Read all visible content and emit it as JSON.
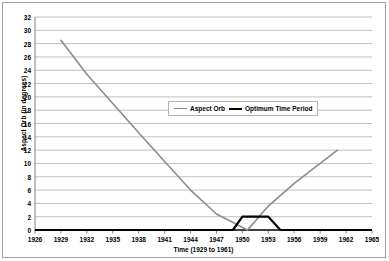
{
  "chart_data": {
    "type": "line",
    "title": "",
    "xlabel": "Time (1929 to 1961)",
    "ylabel": "Aspect Orb (in degrees)",
    "xlim": [
      1926,
      1965
    ],
    "ylim": [
      0,
      32
    ],
    "xticks": [
      1926,
      1929,
      1932,
      1935,
      1938,
      1941,
      1944,
      1947,
      1950,
      1953,
      1956,
      1959,
      1962,
      1965
    ],
    "yticks": [
      0,
      2,
      4,
      6,
      8,
      10,
      12,
      14,
      16,
      18,
      20,
      22,
      24,
      26,
      28,
      30,
      32
    ],
    "grid": "horizontal",
    "legend_position": "upper-center",
    "series": [
      {
        "name": "Aspect Orb",
        "color": "#8c8c8c",
        "x": [
          1929.0,
          1932.0,
          1935.0,
          1938.0,
          1941.0,
          1944.0,
          1947.0,
          1950.6,
          1953.0,
          1956.0,
          1959.0,
          1961.0
        ],
        "values": [
          28.5,
          23.4,
          19.0,
          14.6,
          10.3,
          6.0,
          2.4,
          0.0,
          3.6,
          7.0,
          10.0,
          12.0
        ]
      },
      {
        "name": "Optimum Time Period",
        "color": "#000000",
        "x": [
          1926.0,
          1948.9,
          1950.0,
          1953.0,
          1954.4,
          1965.0
        ],
        "values": [
          0,
          0,
          2,
          2,
          0,
          0
        ]
      }
    ]
  },
  "legend": {
    "items": [
      {
        "label": "Aspect Orb",
        "swatch": "aspect-orb-line-swatch"
      },
      {
        "label": "Optimum Time Period",
        "swatch": "optimum-time-period-line-swatch"
      }
    ]
  },
  "axes": {
    "y_title": "Aspect Orb (in degrees)",
    "x_title": "Time (1929 to 1961)",
    "y_tick_labels": [
      "0",
      "2",
      "4",
      "6",
      "8",
      "10",
      "12",
      "14",
      "16",
      "18",
      "20",
      "22",
      "24",
      "26",
      "28",
      "30",
      "32"
    ],
    "x_tick_labels": [
      "1926",
      "1929",
      "1932",
      "1935",
      "1938",
      "1941",
      "1944",
      "1947",
      "1950",
      "1953",
      "1956",
      "1959",
      "1962",
      "1965"
    ]
  },
  "colors": {
    "aspect_orb": "#8c8c8c",
    "optimum_time_period": "#000000",
    "gridline": "#c0c0c0",
    "axis": "#808080",
    "border": "#a0a0a0",
    "background": "#ffffff"
  }
}
